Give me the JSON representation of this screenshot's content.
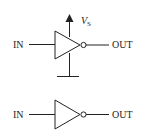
{
  "diagram": {
    "top_inverter": {
      "input_label": "IN",
      "output_label": "OUT",
      "supply_label": "V",
      "supply_subscript": "S"
    },
    "bottom_inverter": {
      "input_label": "IN",
      "output_label": "OUT"
    },
    "colors": {
      "stroke": "#222222",
      "background": "#ffffff"
    }
  }
}
